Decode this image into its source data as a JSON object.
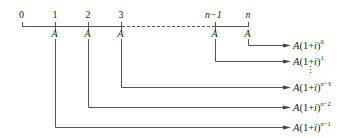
{
  "diagram": {
    "type": "annuity timeline",
    "timeline": {
      "ticks": [
        "0",
        "1",
        "2",
        "3",
        "n−1",
        "n"
      ],
      "payment_label": "A",
      "dashed_between": [
        "3",
        "n−1"
      ]
    },
    "results": [
      {
        "from_tick": "n",
        "base": "A(1+i)",
        "exponent": "0"
      },
      {
        "from_tick": "n−1",
        "base": "A(1+i)",
        "exponent": "1"
      },
      {
        "ellipsis": "⋮"
      },
      {
        "from_tick": "3",
        "base": "A(1+i)",
        "exponent": "n−3"
      },
      {
        "from_tick": "2",
        "base": "A(1+i)",
        "exponent": "n−2"
      },
      {
        "from_tick": "1",
        "base": "A(1+i)",
        "exponent": "n−1"
      }
    ],
    "colors": {
      "line": "#555555",
      "text": "#222222"
    }
  }
}
